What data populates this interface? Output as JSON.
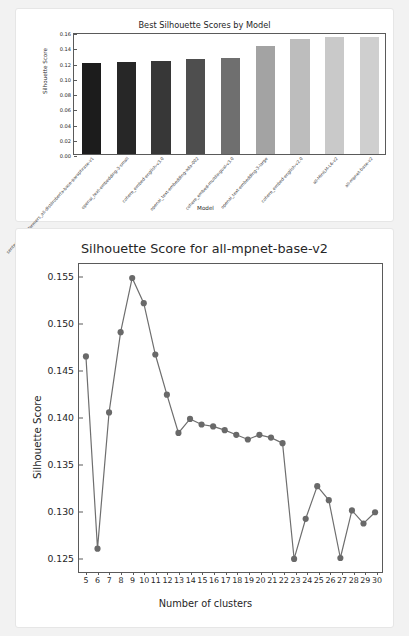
{
  "chart_data": [
    {
      "type": "bar",
      "title": "Best Silhouette Scores by Model",
      "xlabel": "Model",
      "ylabel": "Silhouette Score",
      "ylim": [
        0.0,
        0.16
      ],
      "yticks": [
        "0.00",
        "0.02",
        "0.04",
        "0.06",
        "0.08",
        "0.10",
        "0.12",
        "0.14",
        "0.16"
      ],
      "ytick_values": [
        0.0,
        0.02,
        0.04,
        0.06,
        0.08,
        0.1,
        0.12,
        0.14,
        0.16
      ],
      "grid": false,
      "legend": "none",
      "categories": [
        "sentence-transformers_all-distilroberta-base-paraphrase-v1",
        "openai_text-embedding-3-small",
        "cohere_embed-english-v3.0",
        "openai_text-embedding-ada-002",
        "cohere_embed-multilingual-v3.0",
        "openai_text-embedding-3-large",
        "cohere_embed-english-v2.0",
        "all-MiniLM-L6-v2",
        "all-mpnet-base-v2"
      ],
      "values": [
        0.119,
        0.1205,
        0.122,
        0.1243,
        0.1262,
        0.1417,
        0.1503,
        0.1535,
        0.1538
      ],
      "bar_colors": [
        "#1c1c1c",
        "#272727",
        "#373737",
        "#4e4e4e",
        "#6f6f6f",
        "#a3a3a3",
        "#bdbdbd",
        "#c9c9c9",
        "#cfcfcf"
      ]
    },
    {
      "type": "line",
      "title": "Silhouette Score for all-mpnet-base-v2",
      "xlabel": "Number of clusters",
      "ylabel": "Silhouette Score",
      "xlim": [
        4.4,
        30.6
      ],
      "ylim": [
        0.1233,
        0.1563
      ],
      "yticks": [
        "0.125",
        "0.130",
        "0.135",
        "0.140",
        "0.145",
        "0.150",
        "0.155"
      ],
      "ytick_values": [
        0.125,
        0.13,
        0.135,
        0.14,
        0.145,
        0.15,
        0.155
      ],
      "grid": false,
      "legend": "none",
      "marker": "circle",
      "line_color": "#6e6e6e",
      "marker_color": "#696969",
      "x": [
        5,
        6,
        7,
        8,
        9,
        10,
        11,
        12,
        13,
        14,
        15,
        16,
        17,
        18,
        19,
        20,
        21,
        22,
        23,
        24,
        25,
        26,
        27,
        28,
        29,
        30
      ],
      "values": [
        0.1464,
        0.1258,
        0.1404,
        0.149,
        0.1548,
        0.1521,
        0.1466,
        0.1423,
        0.1382,
        0.1397,
        0.1391,
        0.1389,
        0.1385,
        0.138,
        0.1375,
        0.138,
        0.1377,
        0.1371,
        0.1247,
        0.129,
        0.1325,
        0.131,
        0.1248,
        0.1299,
        0.1285,
        0.1297
      ]
    }
  ]
}
